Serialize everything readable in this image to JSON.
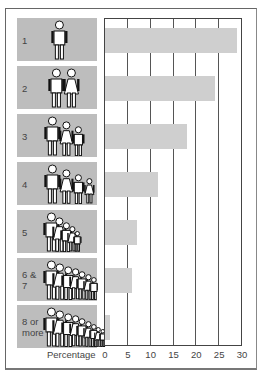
{
  "chart_data": {
    "type": "bar",
    "orientation": "horizontal",
    "title": "",
    "xlabel": "Percentage",
    "ylabel": "Household size",
    "categories": [
      "1",
      "2",
      "3",
      "4",
      "5",
      "6 & 7",
      "8 or more"
    ],
    "values": [
      29,
      24,
      18,
      11.5,
      7,
      6,
      1
    ],
    "xlim": [
      0,
      30
    ],
    "xticks": [
      0,
      5,
      10,
      15,
      20,
      25,
      30
    ],
    "grid": true,
    "legend": null,
    "bar_color": "#cfcfcf",
    "panel_color": "#bdbdbd"
  },
  "panels": [
    {
      "label_lines": [
        "1"
      ],
      "people": 1
    },
    {
      "label_lines": [
        "2"
      ],
      "people": 2
    },
    {
      "label_lines": [
        "3"
      ],
      "people": 3
    },
    {
      "label_lines": [
        "4"
      ],
      "people": 4
    },
    {
      "label_lines": [
        "5"
      ],
      "people": 5
    },
    {
      "label_lines": [
        "6 &",
        "7"
      ],
      "people": 7
    },
    {
      "label_lines": [
        "8 or",
        "more"
      ],
      "people": 9
    }
  ],
  "axis": {
    "label": "Percentage",
    "ticks": [
      "0",
      "5",
      "10",
      "15",
      "20",
      "25",
      "30"
    ]
  }
}
